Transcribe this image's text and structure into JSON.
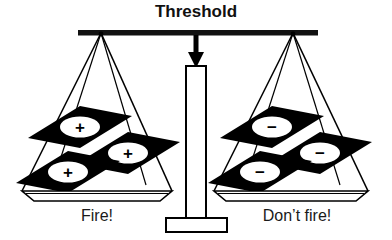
{
  "diagram": {
    "title": "Threshold",
    "type": "balance-scale",
    "arrow": "down-arrow-icon",
    "colors": {
      "ink": "#000000",
      "tile_fill": "#000000",
      "symbol_disc": "#ffffff",
      "background": "#ffffff",
      "beam": "#111111"
    },
    "pans": [
      {
        "side": "left",
        "label": "Fire!",
        "symbol": "+",
        "symbol_name": "plus-sign",
        "count": 3,
        "tiles": [
          {
            "cx": 80,
            "cy": 127,
            "symbol": "+"
          },
          {
            "cx": 128,
            "cy": 153,
            "symbol": "+"
          },
          {
            "cx": 68,
            "cy": 172,
            "symbol": "+"
          }
        ]
      },
      {
        "side": "right",
        "label": "Don’t fire!",
        "symbol": "−",
        "symbol_name": "minus-sign",
        "count": 3,
        "tiles": [
          {
            "cx": 272,
            "cy": 127,
            "symbol": "−"
          },
          {
            "cx": 320,
            "cy": 153,
            "symbol": "−"
          },
          {
            "cx": 260,
            "cy": 172,
            "symbol": "−"
          }
        ]
      }
    ]
  }
}
